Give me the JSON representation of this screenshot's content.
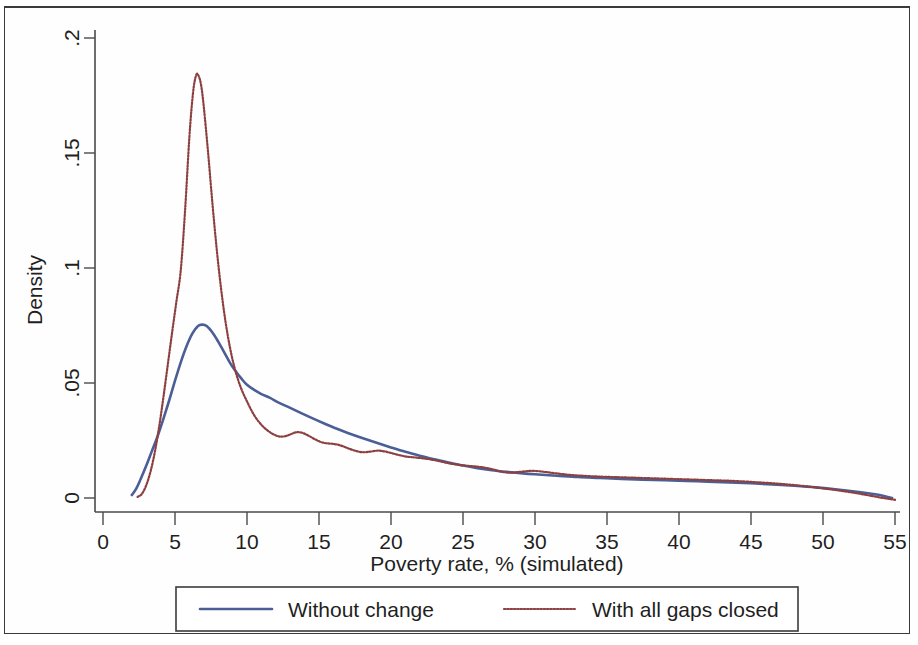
{
  "chart_data": {
    "type": "line",
    "title": "",
    "xlabel": "Poverty rate, % (simulated)",
    "ylabel": "Density",
    "xlim": [
      0,
      55
    ],
    "ylim": [
      0,
      0.2
    ],
    "xticks": [
      "0",
      "5",
      "10",
      "15",
      "20",
      "25",
      "30",
      "35",
      "40",
      "45",
      "50",
      "55"
    ],
    "yticks": [
      "0",
      ".05",
      ".1",
      ".15",
      ".2"
    ],
    "grid": false,
    "legend_position": "below-plot",
    "series": [
      {
        "name": "Without change",
        "color": "#4b5f96",
        "style": "solid",
        "x": [
          2.0,
          2.3,
          2.6,
          3.0,
          3.4,
          3.8,
          4.2,
          4.6,
          5.0,
          5.4,
          5.8,
          6.2,
          6.6,
          6.9,
          7.2,
          7.6,
          8.0,
          8.4,
          8.8,
          9.2,
          9.6,
          10.0,
          10.5,
          11.0,
          11.6,
          12.2,
          13.0,
          13.8,
          14.6,
          15.4,
          16.2,
          17.0,
          18.0,
          19.0,
          20.0,
          21.0,
          22.0,
          23.0,
          24.0,
          25.0,
          26.0,
          27.0,
          28.0,
          29.0,
          30.0,
          31.5,
          33.0,
          34.5,
          36.0,
          37.5,
          39.0,
          40.5,
          42.0,
          43.5,
          45.0,
          46.5,
          48.0,
          49.5,
          51.0,
          52.5,
          53.5,
          54.3,
          54.8
        ],
        "y": [
          0.0013,
          0.004,
          0.008,
          0.014,
          0.0205,
          0.027,
          0.0345,
          0.0425,
          0.051,
          0.059,
          0.066,
          0.0715,
          0.0748,
          0.0754,
          0.0748,
          0.072,
          0.068,
          0.0635,
          0.059,
          0.0552,
          0.052,
          0.0492,
          0.047,
          0.0452,
          0.0435,
          0.0415,
          0.0392,
          0.0368,
          0.0345,
          0.0323,
          0.0302,
          0.0283,
          0.0261,
          0.024,
          0.022,
          0.0201,
          0.0184,
          0.0168,
          0.0154,
          0.0141,
          0.013,
          0.0121,
          0.0114,
          0.0108,
          0.0103,
          0.0097,
          0.0091,
          0.0087,
          0.0083,
          0.008,
          0.0077,
          0.0074,
          0.0071,
          0.0068,
          0.0064,
          0.0059,
          0.0053,
          0.0046,
          0.0037,
          0.0026,
          0.0017,
          0.0008,
          0.0
        ]
      },
      {
        "name": "With all gaps closed",
        "color": "#8d4040",
        "style": "dotted",
        "x": [
          2.4,
          2.7,
          3.0,
          3.3,
          3.6,
          3.9,
          4.2,
          4.5,
          4.8,
          5.1,
          5.4,
          5.7,
          6.0,
          6.25,
          6.45,
          6.6,
          6.8,
          7.0,
          7.3,
          7.6,
          7.9,
          8.2,
          8.5,
          8.8,
          9.1,
          9.4,
          9.7,
          10.0,
          10.3,
          10.6,
          11.0,
          11.4,
          11.8,
          12.2,
          12.6,
          13.0,
          13.3,
          13.6,
          13.9,
          14.3,
          14.7,
          15.1,
          15.5,
          15.9,
          16.3,
          16.7,
          17.1,
          17.6,
          18.1,
          18.6,
          19.1,
          19.6,
          20.1,
          20.6,
          21.1,
          21.7,
          22.3,
          22.9,
          23.5,
          24.1,
          24.7,
          25.3,
          25.9,
          26.5,
          27.1,
          27.7,
          28.3,
          29.0,
          29.8,
          30.6,
          31.5,
          32.5,
          33.5,
          34.5,
          35.5,
          36.5,
          37.5,
          38.5,
          39.5,
          40.5,
          41.5,
          42.5,
          43.5,
          44.5,
          45.5,
          46.5,
          47.5,
          48.5,
          49.5,
          50.5,
          51.5,
          52.5,
          53.3,
          54.0,
          54.6,
          55.0
        ],
        "y": [
          0.0005,
          0.0018,
          0.0055,
          0.0115,
          0.02,
          0.031,
          0.044,
          0.058,
          0.072,
          0.0855,
          0.099,
          0.125,
          0.157,
          0.176,
          0.1835,
          0.184,
          0.18,
          0.17,
          0.15,
          0.128,
          0.108,
          0.091,
          0.077,
          0.066,
          0.0575,
          0.051,
          0.046,
          0.042,
          0.0382,
          0.035,
          0.0318,
          0.0295,
          0.0278,
          0.0268,
          0.0268,
          0.0276,
          0.0284,
          0.0286,
          0.0282,
          0.027,
          0.0256,
          0.0244,
          0.0238,
          0.0236,
          0.0232,
          0.0224,
          0.0214,
          0.0204,
          0.0199,
          0.0202,
          0.0206,
          0.0202,
          0.0194,
          0.0186,
          0.018,
          0.0176,
          0.0172,
          0.0166,
          0.0158,
          0.015,
          0.0144,
          0.014,
          0.0137,
          0.0132,
          0.0124,
          0.0114,
          0.011,
          0.0114,
          0.0118,
          0.0114,
          0.0107,
          0.01,
          0.0096,
          0.0093,
          0.0091,
          0.0089,
          0.0087,
          0.0085,
          0.0083,
          0.0081,
          0.0079,
          0.0077,
          0.0075,
          0.0072,
          0.0068,
          0.0064,
          0.0059,
          0.0053,
          0.0046,
          0.0038,
          0.0029,
          0.0019,
          0.001,
          0.0002,
          -0.0004,
          -0.0008
        ]
      }
    ]
  },
  "legend": {
    "items": [
      {
        "label": "Without change",
        "color": "#4b5f96",
        "style": "solid"
      },
      {
        "label": "With all gaps closed",
        "color": "#8d4040",
        "style": "dotted"
      }
    ]
  }
}
